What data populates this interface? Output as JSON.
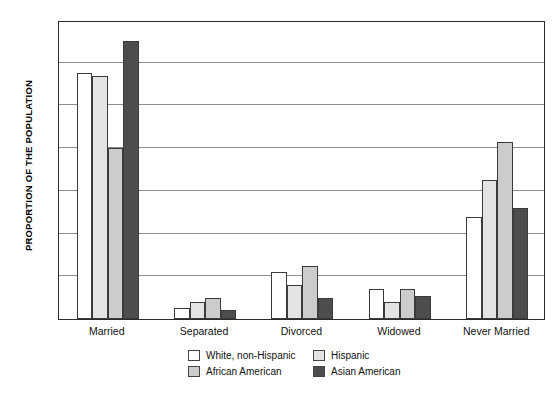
{
  "chart_data": {
    "type": "bar",
    "title": "",
    "xlabel": "",
    "ylabel": "PROPORTION OF THE POPULATION",
    "ylim": [
      0,
      70
    ],
    "yticks": [
      0,
      10,
      20,
      30,
      40,
      50,
      60,
      70
    ],
    "grid": true,
    "legend_position": "bottom",
    "categories": [
      "Married",
      "Separated",
      "Divorced",
      "Widowed",
      "Never Married"
    ],
    "series": [
      {
        "name": "White, non-Hispanic",
        "color": "#ffffff",
        "values": [
          57.5,
          2.5,
          11.0,
          7.0,
          24.0
        ]
      },
      {
        "name": "Hispanic",
        "color": "#e3e3e3",
        "values": [
          57.0,
          4.0,
          8.0,
          4.0,
          32.5
        ]
      },
      {
        "name": "African American",
        "color": "#cccccc",
        "values": [
          40.0,
          5.0,
          12.5,
          7.0,
          41.5
        ]
      },
      {
        "name": "Asian American",
        "color": "#4d4d4d",
        "values": [
          65.0,
          2.0,
          5.0,
          5.5,
          26.0
        ]
      }
    ]
  },
  "axis": {
    "y_title": "PROPORTION OF THE POPULATION",
    "y_tick_labels": [
      "70",
      "60",
      "50",
      "40",
      "30",
      "20",
      "10",
      "0"
    ],
    "x_tick_labels": [
      "Married",
      "Separated",
      "Divorced",
      "Widowed",
      "Never Married"
    ]
  },
  "legend": {
    "items": [
      {
        "label": "White, non-Hispanic",
        "color": "#ffffff"
      },
      {
        "label": "Hispanic",
        "color": "#e3e3e3"
      },
      {
        "label": "African American",
        "color": "#cccccc"
      },
      {
        "label": "Asian American",
        "color": "#4d4d4d"
      }
    ]
  },
  "caption": {
    "text": ""
  }
}
